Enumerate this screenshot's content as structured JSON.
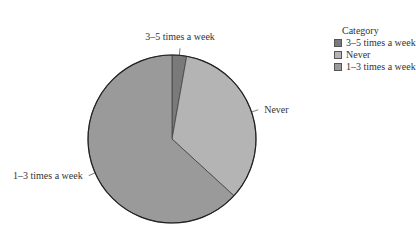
{
  "chart_data": {
    "type": "pie",
    "title": "",
    "categories": [
      "3–5 times a week",
      "Never",
      "1–3 times a week"
    ],
    "values": [
      2.8,
      34.0,
      63.2
    ],
    "colors": [
      "#7a7a7a",
      "#b4b4b4",
      "#9a9a9a"
    ],
    "start_angle_deg": 0,
    "direction": "clockwise",
    "legend": {
      "title": "Category",
      "position": "top-right",
      "items": [
        "3–5 times a week",
        "Never",
        "1–3 times a week"
      ]
    }
  }
}
